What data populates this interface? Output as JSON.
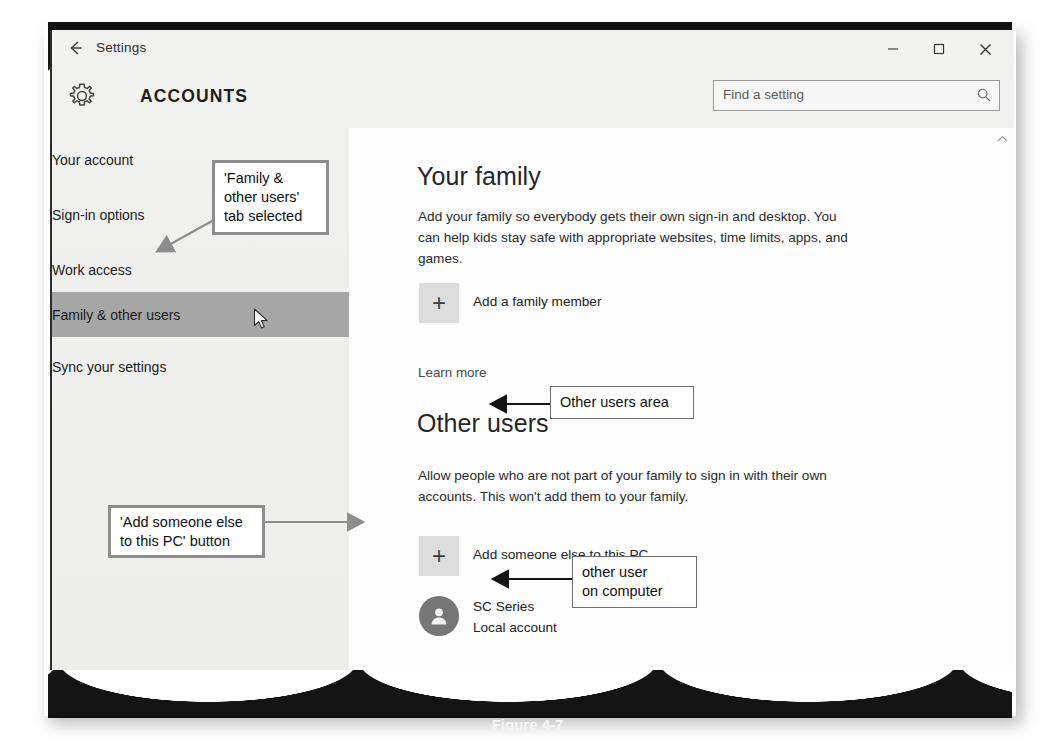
{
  "window": {
    "back_icon": "back-arrow-icon",
    "title": "Settings",
    "section_title": "ACCOUNTS",
    "gear_icon": "gear-icon",
    "minimize_label": "─",
    "maximize_label": "□",
    "close_label": "✕"
  },
  "search": {
    "placeholder": "Find a setting",
    "value": "",
    "icon": "search-icon"
  },
  "sidebar": {
    "items": [
      {
        "label": "Your account",
        "selected": false
      },
      {
        "label": "Sign-in options",
        "selected": false
      },
      {
        "label": "Work access",
        "selected": false
      },
      {
        "label": "Family & other users",
        "selected": true
      },
      {
        "label": "Sync your settings",
        "selected": false
      }
    ],
    "selected_bg": "#a6a6a6"
  },
  "main": {
    "family": {
      "heading": "Your family",
      "description": "Add your family so everybody gets their own sign-in and desktop. You can help kids stay safe with appropriate websites, time limits, apps, and games.",
      "add_button_label": "Add a family member",
      "add_button_icon": "plus-icon",
      "learn_more": "Learn more"
    },
    "other_users": {
      "heading": "Other users",
      "description": "Allow people who are not part of your family to sign in with their own accounts. This won't add them to your family.",
      "add_button_label": "Add someone else to this PC",
      "add_button_icon": "plus-icon",
      "accounts": [
        {
          "name": "SC Series",
          "type": "Local account",
          "avatar_icon": "person-icon"
        }
      ]
    },
    "scroll_up_icon": "chevron-up-icon"
  },
  "annotations": [
    {
      "id": "family-tab-callout",
      "text": "'Family &\nother users'\ntab selected"
    },
    {
      "id": "other-users-area-callout",
      "text": "Other users area"
    },
    {
      "id": "add-someone-else-callout",
      "text": "'Add someone else\nto this PC' button"
    },
    {
      "id": "other-user-on-computer-callout",
      "text": "other user\non computer"
    }
  ],
  "annotation_text": {
    "family_tab_line1": "'Family &",
    "family_tab_line2": "other users'",
    "family_tab_line3": "tab selected",
    "other_users_area": "Other users area",
    "add_someone_line1": "'Add someone else",
    "add_someone_line2": "to this PC' button",
    "other_user_line1": "other user",
    "other_user_line2": "on computer"
  },
  "caption": "Figure 4-7"
}
